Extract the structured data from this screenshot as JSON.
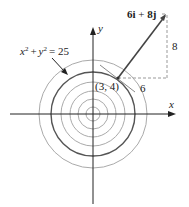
{
  "diagram": {
    "equation_label": "x² + y² = 25",
    "equation_parts": {
      "x": "x",
      "x_exp": "2",
      "plus": "+",
      "y": "y",
      "y_exp": "2",
      "eq": "= 25"
    },
    "point_label": "(3, 4)",
    "vector_label": "6i + 8j",
    "vector_parts": {
      "a": "6",
      "i": "i",
      "plus": " + ",
      "b": "8",
      "j": "j"
    },
    "horizontal_component": "6",
    "vertical_component": "8",
    "x_axis_label": "x",
    "y_axis_label": "y",
    "colors": {
      "dark_circle": "#555555",
      "light_circle": "#aaaaaa",
      "axes": "#222222",
      "vector": "#444444",
      "dashed": "#999999"
    }
  }
}
